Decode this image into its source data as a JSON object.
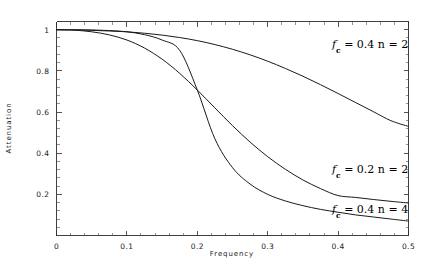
{
  "chart_data": {
    "type": "line",
    "title": "",
    "xlabel": "Frequency",
    "ylabel": "Attenuation",
    "xlim": [
      0,
      0.5
    ],
    "ylim": [
      0,
      1.04
    ],
    "grid": false,
    "legend_position": "inline-annotations",
    "xticks": [
      "0",
      "0.1",
      "0.2",
      "0.3",
      "0.4",
      "0.5"
    ],
    "xtick_values": [
      0,
      0.1,
      0.2,
      0.3,
      0.4,
      0.5
    ],
    "yticks": [
      "0.2",
      "0.4",
      "0.6",
      "0.8",
      "1"
    ],
    "ytick_values": [
      0.2,
      0.4,
      0.6,
      0.8,
      1.0
    ],
    "series": [
      {
        "name": "fc = 0.4 n = 2",
        "fc": 0.4,
        "n": 2,
        "x": [
          0,
          0.025,
          0.05,
          0.075,
          0.1,
          0.125,
          0.15,
          0.175,
          0.2,
          0.225,
          0.25,
          0.275,
          0.3,
          0.325,
          0.35,
          0.375,
          0.4,
          0.425,
          0.45,
          0.475,
          0.5
        ],
        "values": [
          1.0,
          0.999,
          0.997,
          0.994,
          0.99,
          0.983,
          0.974,
          0.962,
          0.947,
          0.928,
          0.905,
          0.878,
          0.847,
          0.812,
          0.774,
          0.733,
          0.69,
          0.646,
          0.602,
          0.558,
          0.53
        ]
      },
      {
        "name": "fc = 0.2 n = 2",
        "fc": 0.2,
        "n": 2,
        "x": [
          0,
          0.025,
          0.05,
          0.075,
          0.1,
          0.125,
          0.15,
          0.175,
          0.2,
          0.225,
          0.25,
          0.275,
          0.3,
          0.325,
          0.35,
          0.375,
          0.4,
          0.425,
          0.45,
          0.475,
          0.5
        ],
        "values": [
          1.0,
          0.998,
          0.99,
          0.975,
          0.95,
          0.911,
          0.857,
          0.788,
          0.707,
          0.62,
          0.534,
          0.454,
          0.383,
          0.322,
          0.27,
          0.228,
          0.194,
          0.185,
          0.175,
          0.166,
          0.158
        ]
      },
      {
        "name": "fc = 0.4 n = 4",
        "fc": 0.4,
        "n": 4,
        "x": [
          0,
          0.025,
          0.05,
          0.075,
          0.1,
          0.125,
          0.15,
          0.175,
          0.2,
          0.225,
          0.25,
          0.275,
          0.3,
          0.325,
          0.35,
          0.375,
          0.4,
          0.425,
          0.45,
          0.475,
          0.5
        ],
        "values": [
          1.0,
          1.0,
          0.999,
          0.996,
          0.99,
          0.976,
          0.95,
          0.9,
          0.707,
          0.47,
          0.33,
          0.25,
          0.2,
          0.168,
          0.145,
          0.127,
          0.113,
          0.1,
          0.09,
          0.08,
          0.07
        ]
      }
    ],
    "annotations": [
      {
        "id": "annot-fc04-n2",
        "prefix": "f",
        "subscript": "c",
        "text": " = 0.4  n = 2",
        "full_text": "fc = 0.4 n = 2",
        "x_px": 332,
        "y_px": 48
      },
      {
        "id": "annot-fc02-n2",
        "prefix": "f",
        "subscript": "c",
        "text": " = 0.2  n = 2",
        "full_text": "fc = 0.2 n = 2",
        "x_px": 332,
        "y_px": 173
      },
      {
        "id": "annot-fc04-n4",
        "prefix": "f",
        "subscript": "c",
        "text": " = 0.4  n = 4",
        "full_text": "fc = 0.4 n = 4",
        "x_px": 332,
        "y_px": 213
      }
    ],
    "colors": {
      "curve": "#1a1a1a",
      "frame": "#2b2b2b",
      "background": "#ffffff",
      "text": "#1a1a1a"
    }
  }
}
